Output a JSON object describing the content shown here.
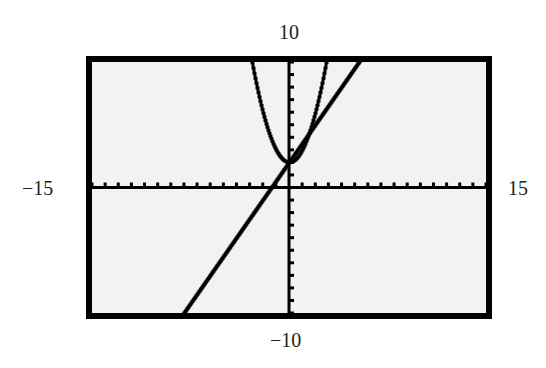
{
  "chart_data": {
    "type": "line",
    "title": "",
    "xlabel": "",
    "ylabel": "",
    "xlim": [
      -15,
      15
    ],
    "ylim": [
      -10,
      10
    ],
    "xscl": 1,
    "yscl": 1,
    "grid": false,
    "window_labels": {
      "xmin": "−15",
      "xmax": "15",
      "ymin": "−10",
      "ymax": "10"
    },
    "series": [
      {
        "name": "parabola",
        "equation": "y = x^2 + 2",
        "points": [
          [
            -2.83,
            10
          ],
          [
            -2,
            6
          ],
          [
            -1,
            3
          ],
          [
            0,
            2
          ],
          [
            1,
            3
          ],
          [
            2,
            6
          ],
          [
            2.83,
            10
          ]
        ]
      },
      {
        "name": "line",
        "equation": "y = 1.5x + 2",
        "points": [
          [
            -7.6,
            -9.4
          ],
          [
            -1.33,
            0
          ],
          [
            0,
            2
          ],
          [
            5.33,
            10
          ]
        ]
      }
    ]
  },
  "colors": {
    "screen_bg": "#f2f2f2",
    "ink": "#000000"
  }
}
